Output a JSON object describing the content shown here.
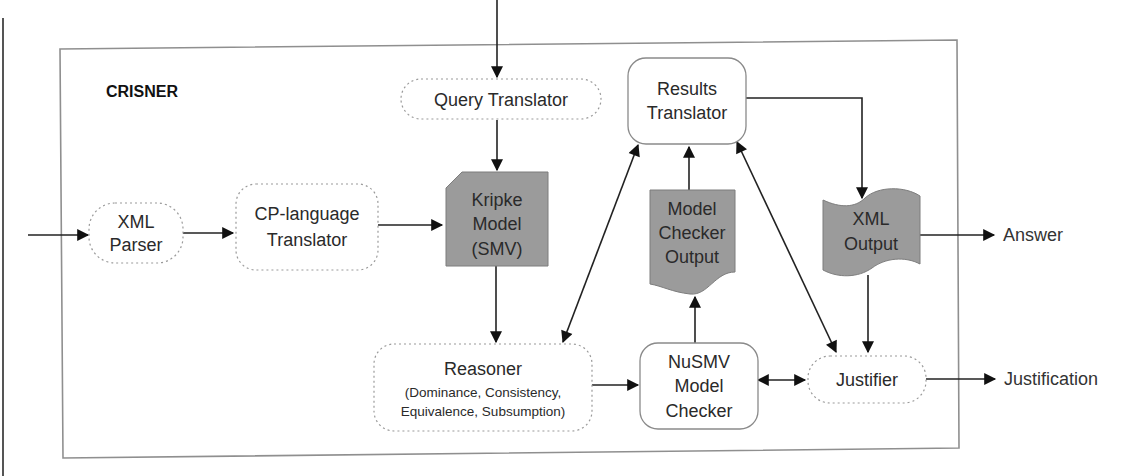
{
  "diagram": {
    "system_label": "CRISNER",
    "nodes": {
      "xml_parser": {
        "line1": "XML",
        "line2": "Parser",
        "style": "dotted-rounded"
      },
      "cp_translator": {
        "line1": "CP-language",
        "line2": "Translator",
        "style": "dotted-rounded"
      },
      "query_translator": {
        "line1": "Query Translator",
        "style": "dotted-rounded"
      },
      "kripke_model": {
        "line1": "Kripke",
        "line2": "Model",
        "line3": "(SMV)",
        "style": "shaded-card"
      },
      "results_translator": {
        "line1": "Results",
        "line2": "Translator",
        "style": "solid-rounded"
      },
      "model_checker_output": {
        "line1": "Model",
        "line2": "Checker",
        "line3": "Output",
        "style": "shaded-document"
      },
      "xml_output": {
        "line1": "XML",
        "line2": "Output",
        "style": "shaded-punched-tape"
      },
      "reasoner": {
        "line1": "Reasoner",
        "line2": "(Dominance, Consistency,",
        "line3": "Equivalence, Subsumption)",
        "style": "dotted-rounded"
      },
      "nusmv": {
        "line1": "NuSMV",
        "line2": "Model",
        "line3": "Checker",
        "style": "solid-rounded"
      },
      "justifier": {
        "line1": "Justifier",
        "style": "dotted-rounded"
      }
    },
    "outputs": {
      "answer": "Answer",
      "justification": "Justification"
    },
    "edges": [
      {
        "from": "external-input",
        "to": "xml_parser"
      },
      {
        "from": "xml_parser",
        "to": "cp_translator"
      },
      {
        "from": "cp_translator",
        "to": "kripke_model"
      },
      {
        "from": "external-query",
        "to": "query_translator"
      },
      {
        "from": "query_translator",
        "to": "kripke_model"
      },
      {
        "from": "kripke_model",
        "to": "reasoner"
      },
      {
        "from": "reasoner",
        "to": "results_translator",
        "bidirectional": true
      },
      {
        "from": "reasoner",
        "to": "nusmv"
      },
      {
        "from": "nusmv",
        "to": "model_checker_output"
      },
      {
        "from": "model_checker_output",
        "to": "results_translator"
      },
      {
        "from": "results_translator",
        "to": "justifier",
        "bidirectional": true
      },
      {
        "from": "results_translator",
        "to": "xml_output"
      },
      {
        "from": "xml_output",
        "to": "answer"
      },
      {
        "from": "xml_output",
        "to": "justifier"
      },
      {
        "from": "nusmv",
        "to": "justifier",
        "bidirectional": true
      },
      {
        "from": "justifier",
        "to": "justification"
      }
    ],
    "colors": {
      "shaded_fill": "#9b9b9b",
      "border": "#8f8f8f",
      "arrow": "#222222"
    }
  }
}
